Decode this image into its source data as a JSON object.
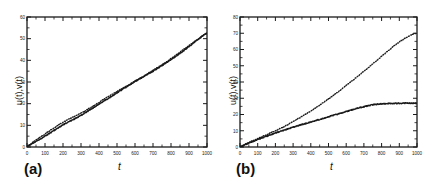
{
  "figure": {
    "background": "#ffffff",
    "ink": "#1a1a1a"
  },
  "panels": [
    {
      "tag": "(a)",
      "xlabel": "t",
      "ylabel": "u(t),v(t)"
    },
    {
      "tag": "(b)",
      "xlabel": "t",
      "ylabel": "u(t),v(t)"
    }
  ],
  "chart_data": [
    {
      "type": "line",
      "title": "(a)",
      "xlabel": "t",
      "ylabel": "u(t),v(t)",
      "xlim": [
        0,
        1000
      ],
      "ylim": [
        0,
        60
      ],
      "xticks": [
        0,
        100,
        200,
        300,
        400,
        500,
        600,
        700,
        800,
        900,
        1000
      ],
      "xticklabels": [
        "0",
        "100",
        "200",
        "300",
        "400",
        "500",
        "600",
        "700",
        "800",
        "900",
        "1000"
      ],
      "yticks": [
        0,
        10,
        20,
        30,
        40,
        50,
        60
      ],
      "yticklabels": [
        "0",
        "10",
        "20",
        "30",
        "40",
        "50",
        "60"
      ],
      "grid": false,
      "legend": null,
      "x": [
        0,
        50,
        100,
        150,
        200,
        250,
        300,
        350,
        400,
        450,
        500,
        550,
        600,
        650,
        700,
        750,
        800,
        850,
        900,
        950,
        1000
      ],
      "series": [
        {
          "name": "u(t)",
          "style": "solid",
          "values": [
            0.4,
            2.6,
            5.0,
            7.6,
            10.2,
            12.4,
            14.6,
            17.2,
            19.8,
            22.4,
            25.0,
            27.6,
            30.2,
            32.6,
            35.0,
            37.6,
            40.4,
            43.2,
            46.4,
            49.6,
            52.6
          ]
        },
        {
          "name": "v(t)",
          "style": "dotted",
          "values": [
            0.5,
            3.2,
            6.0,
            8.8,
            11.4,
            13.6,
            15.6,
            18.0,
            20.6,
            23.2,
            25.6,
            28.0,
            30.4,
            32.8,
            35.4,
            38.0,
            40.8,
            43.8,
            46.8,
            49.8,
            52.4
          ]
        }
      ]
    },
    {
      "type": "line",
      "title": "(b)",
      "xlabel": "t",
      "ylabel": "u(t),v(t)",
      "xlim": [
        0,
        1000
      ],
      "ylim": [
        0,
        80
      ],
      "xticks": [
        0,
        100,
        200,
        300,
        400,
        500,
        600,
        700,
        800,
        900,
        1000
      ],
      "xticklabels": [
        "0",
        "100",
        "200",
        "300",
        "400",
        "500",
        "600",
        "700",
        "800",
        "900",
        "1000"
      ],
      "yticks": [
        0,
        10,
        20,
        30,
        40,
        50,
        60,
        70,
        80
      ],
      "yticklabels": [
        "0",
        "10",
        "20",
        "30",
        "40",
        "50",
        "60",
        "70",
        "80"
      ],
      "grid": false,
      "legend": null,
      "x": [
        0,
        50,
        100,
        150,
        200,
        250,
        300,
        350,
        400,
        450,
        500,
        550,
        600,
        650,
        700,
        750,
        800,
        850,
        900,
        950,
        1000
      ],
      "series": [
        {
          "name": "u(t)",
          "style": "solid",
          "values": [
            0.3,
            2.4,
            4.6,
            6.6,
            8.6,
            10.4,
            12.2,
            13.8,
            15.4,
            17.0,
            18.6,
            20.2,
            21.8,
            23.4,
            24.8,
            26.0,
            26.6,
            26.8,
            26.9,
            27.0,
            27.0
          ]
        },
        {
          "name": "v(t)",
          "style": "dotted",
          "values": [
            0.4,
            2.8,
            5.2,
            7.6,
            10.0,
            12.6,
            15.6,
            18.8,
            22.2,
            25.8,
            29.6,
            33.6,
            37.8,
            42.2,
            46.6,
            51.2,
            55.8,
            60.4,
            64.6,
            68.0,
            70.2
          ]
        }
      ]
    }
  ]
}
